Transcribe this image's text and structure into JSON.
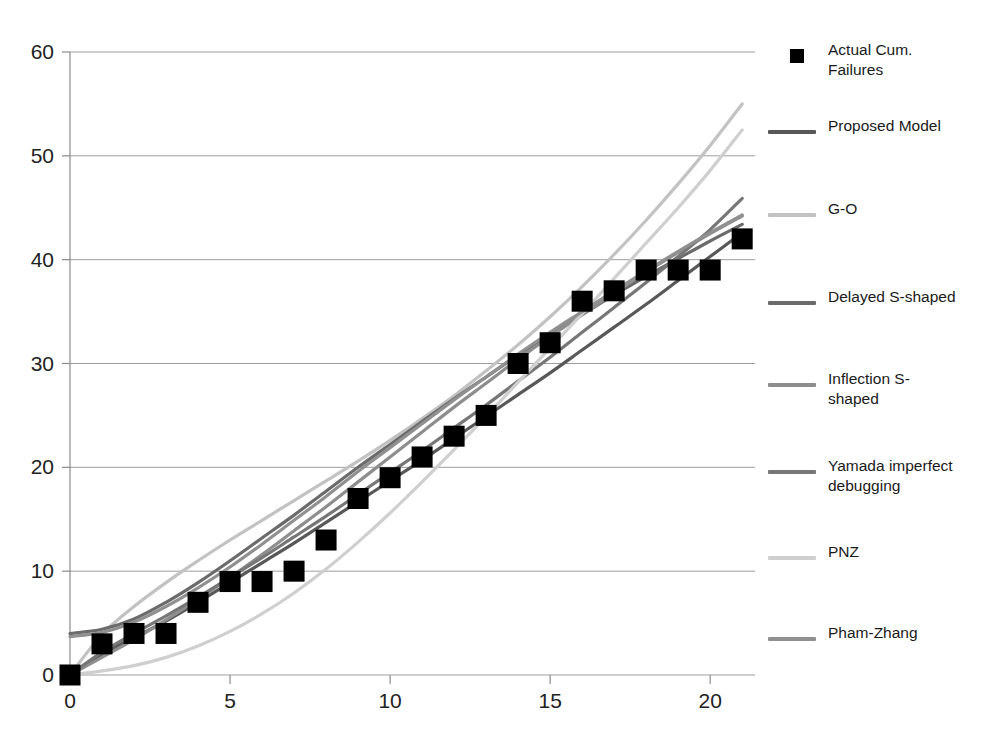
{
  "chart_data": {
    "type": "line",
    "title": "",
    "xlabel": "",
    "ylabel": "",
    "xlim": [
      0,
      21.4
    ],
    "ylim": [
      0,
      60
    ],
    "grid": true,
    "xticks": [
      0,
      5,
      10,
      15,
      20
    ],
    "yticks": [
      0,
      10,
      20,
      30,
      40,
      50,
      60
    ],
    "xtick_labels": [
      "0",
      "5",
      "10",
      "15",
      "20"
    ],
    "ytick_labels": [
      "0",
      "10",
      "20",
      "30",
      "40",
      "50",
      "60"
    ],
    "legend_position": "right",
    "x": [
      0,
      1,
      2,
      3,
      4,
      5,
      6,
      7,
      8,
      9,
      10,
      11,
      12,
      13,
      14,
      15,
      16,
      17,
      18,
      19,
      20,
      21
    ],
    "scatter": {
      "name": "Actual Cum. Failures",
      "marker": "square",
      "color": "#000000",
      "values": [
        0,
        3,
        4,
        4,
        7,
        9,
        9,
        10,
        13,
        17,
        19,
        21,
        23,
        25,
        30,
        32,
        36,
        37,
        39,
        39,
        39,
        42,
        43
      ]
    },
    "series": [
      {
        "name": "Proposed Model",
        "color": "#585858",
        "values": [
          0,
          2.0,
          3.6,
          5.2,
          7.0,
          8.9,
          10.8,
          12.7,
          14.7,
          16.7,
          18.7,
          20.7,
          22.8,
          24.9,
          27.0,
          29.1,
          31.3,
          33.5,
          35.7,
          38.0,
          40.3,
          42.6
        ]
      },
      {
        "name": "G-O",
        "color": "#c2c2c2",
        "values": [
          0,
          3.9,
          6.6,
          8.9,
          11.0,
          13.0,
          14.9,
          16.8,
          18.7,
          20.6,
          22.6,
          24.7,
          26.9,
          29.3,
          31.8,
          34.5,
          37.4,
          40.5,
          43.8,
          47.3,
          51.0,
          55.0
        ]
      },
      {
        "name": "Delayed S-shaped",
        "color": "#6b6b6b",
        "values": [
          4.0,
          4.4,
          5.4,
          7.0,
          8.9,
          11.0,
          13.2,
          15.4,
          17.7,
          20.0,
          22.2,
          24.4,
          26.6,
          28.7,
          30.8,
          32.8,
          34.7,
          36.6,
          38.4,
          40.1,
          41.8,
          43.4
        ]
      },
      {
        "name": "Inflection S-shaped",
        "color": "#8e8e8e",
        "values": [
          0,
          1.7,
          3.4,
          5.3,
          7.3,
          9.4,
          11.6,
          13.9,
          16.2,
          18.6,
          21.0,
          23.4,
          25.8,
          28.1,
          30.4,
          32.6,
          34.7,
          36.8,
          38.8,
          40.7,
          42.5,
          44.2
        ]
      },
      {
        "name": "Yamada imperfect debugging",
        "color": "#777777",
        "values": [
          0,
          2.2,
          4.0,
          5.7,
          7.5,
          9.4,
          11.3,
          13.3,
          15.3,
          17.4,
          19.5,
          21.6,
          23.8,
          26.0,
          28.3,
          30.6,
          33.0,
          35.4,
          37.8,
          40.3,
          42.9,
          45.9
        ]
      },
      {
        "name": "PNZ",
        "color": "#cfcfcf",
        "values": [
          0,
          0.4,
          0.9,
          1.7,
          2.8,
          4.2,
          5.9,
          7.9,
          10.2,
          12.8,
          15.6,
          18.6,
          21.7,
          24.9,
          28.2,
          31.5,
          34.8,
          38.2,
          41.6,
          45.0,
          48.6,
          52.5
        ]
      },
      {
        "name": "Pham-Zhang",
        "color": "#909090",
        "values": [
          3.7,
          4.1,
          5.1,
          6.6,
          8.4,
          10.4,
          12.6,
          14.9,
          17.2,
          19.6,
          21.9,
          24.2,
          26.5,
          28.7,
          30.9,
          33.0,
          35.0,
          37.0,
          38.9,
          40.8,
          42.6,
          44.3
        ]
      }
    ]
  },
  "legend": {
    "entries": [
      {
        "label": "Actual Cum.\nFailures",
        "type": "marker",
        "color": "#000000"
      },
      {
        "label": "Proposed Model",
        "type": "line",
        "color": "#585858"
      },
      {
        "label": "G-O",
        "type": "line",
        "color": "#c2c2c2"
      },
      {
        "label": "Delayed S-shaped",
        "type": "line",
        "color": "#6b6b6b"
      },
      {
        "label": "Inflection S-\nshaped",
        "type": "line",
        "color": "#8e8e8e"
      },
      {
        "label": "Yamada imperfect\ndebugging",
        "type": "line",
        "color": "#777777"
      },
      {
        "label": "PNZ",
        "type": "line",
        "color": "#cfcfcf"
      },
      {
        "label": "Pham-Zhang",
        "type": "line",
        "color": "#909090"
      }
    ]
  }
}
